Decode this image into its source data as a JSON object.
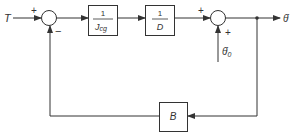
{
  "diagram": {
    "type": "block-diagram",
    "input": {
      "label": "T"
    },
    "summing_junction_1": {
      "plus_sign": "+",
      "minus_sign": "−"
    },
    "block_1": {
      "numerator": "1",
      "denominator": "J",
      "denominator_subscript": "cg"
    },
    "block_2": {
      "numerator": "1",
      "denominator": "D"
    },
    "summing_junction_2": {
      "plus_sign_left": "+",
      "plus_sign_bottom": "+"
    },
    "disturbance_input": {
      "label": "θ̇",
      "subscript": "0"
    },
    "output": {
      "label": "θ̇"
    },
    "feedback_block": {
      "label": "B"
    },
    "colors": {
      "line": "#333333",
      "background": "#ffffff"
    }
  }
}
